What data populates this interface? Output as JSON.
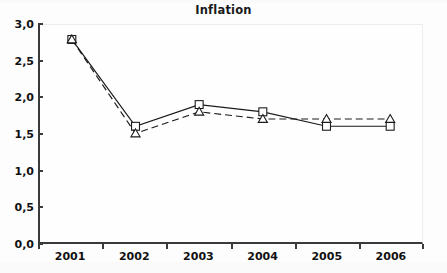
{
  "chart_data": {
    "type": "line",
    "title": "Inflation",
    "xlabel": "",
    "ylabel": "",
    "categories": [
      "2001",
      "2002",
      "2003",
      "2004",
      "2005",
      "2006"
    ],
    "series": [
      {
        "name": "series-1",
        "marker": "square",
        "line_style": "solid",
        "color": "#1a1a1a",
        "values": [
          2.8,
          1.6,
          1.9,
          1.8,
          1.6,
          1.6
        ]
      },
      {
        "name": "series-2",
        "marker": "triangle",
        "line_style": "dashed",
        "color": "#1a1a1a",
        "values": [
          2.8,
          1.5,
          1.8,
          1.7,
          1.7,
          1.7
        ]
      }
    ],
    "ylim": [
      0.0,
      3.0
    ],
    "ytick_values": [
      0.0,
      0.5,
      1.0,
      1.5,
      2.0,
      2.5,
      3.0
    ],
    "ytick_labels": [
      "0,0",
      "0,5",
      "1,0",
      "1,5",
      "2,0",
      "2,5",
      "3,0"
    ],
    "grid": false,
    "legend": "none",
    "decimal_separator": ","
  }
}
